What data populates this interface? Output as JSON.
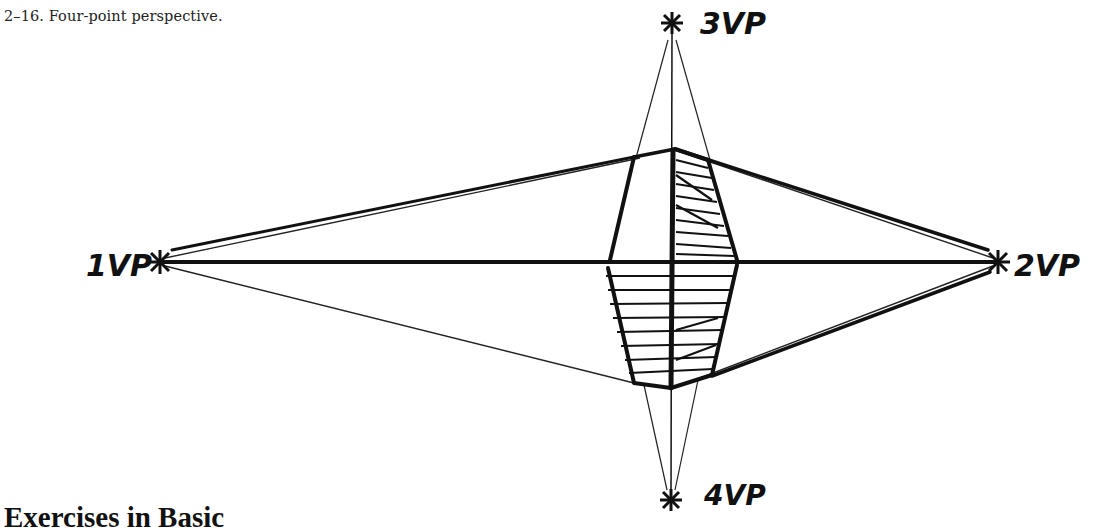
{
  "figure": {
    "caption": "2–16. Four-point perspective.",
    "vanishing_points": [
      {
        "id": "1VP",
        "label": "1VP",
        "x": 160,
        "y": 262
      },
      {
        "id": "2VP",
        "label": "2VP",
        "x": 998,
        "y": 262
      },
      {
        "id": "3VP",
        "label": "3VP",
        "x": 672,
        "y": 23
      },
      {
        "id": "4VP",
        "label": "4VP",
        "x": 671,
        "y": 500
      }
    ]
  },
  "section": {
    "heading": "Exercises in Basic"
  }
}
